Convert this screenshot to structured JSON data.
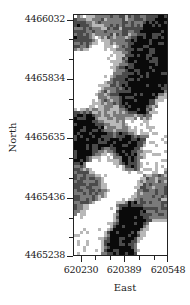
{
  "chart_data": {
    "type": "heatmap",
    "title": "",
    "xlabel": "East",
    "ylabel": "North",
    "x_ticks": [
      "620230",
      "620389",
      "620548"
    ],
    "y_ticks": [
      "4466032",
      "4465834",
      "4465635",
      "4465436",
      "4465238"
    ],
    "xlim": [
      620230,
      620548
    ],
    "ylim": [
      4465238,
      4466032
    ],
    "minor_ticks_between_majors": 2,
    "grid": false,
    "legend": "none",
    "color_classes": [
      "#ffffff",
      "#b8b8b8",
      "#7a7a7a",
      "#4a4a4a",
      "#0a0a0a"
    ]
  },
  "axes": {
    "x_title": "East",
    "y_title": "North",
    "x_labels": [
      "620230",
      "620389",
      "620548"
    ],
    "y_labels": [
      "4466032",
      "4465834",
      "4465635",
      "4465436",
      "4465238"
    ]
  }
}
